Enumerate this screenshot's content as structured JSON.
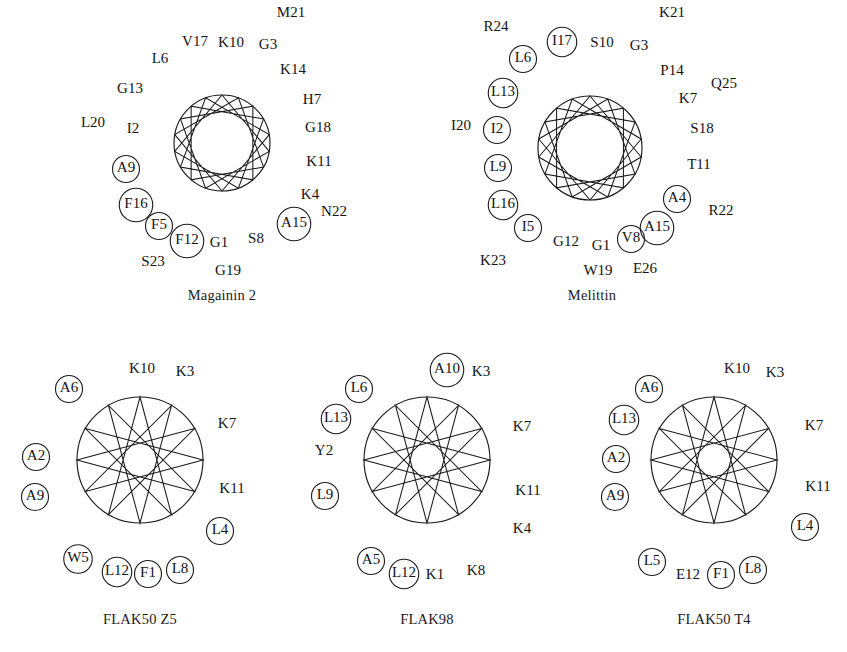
{
  "figure": {
    "width": 847,
    "height": 652,
    "background": "#ffffff",
    "ink_color": "#1b1b1b",
    "text_color": "#141414"
  },
  "panels": [
    {
      "id": "magainin2",
      "caption": "Magainin 2",
      "caption_x": 222,
      "caption_y": 296,
      "center_x": 222,
      "center_y": 143,
      "radius": 48,
      "n_vertices": 18,
      "start_angle": -90,
      "poly_step": 5,
      "residues": [
        {
          "label": "M21",
          "x": 291,
          "y": 14,
          "circled": false
        },
        {
          "label": "V17",
          "x": 195,
          "y": 43,
          "circled": false
        },
        {
          "label": "K10",
          "x": 231,
          "y": 44,
          "circled": false
        },
        {
          "label": "G3",
          "x": 268,
          "y": 46,
          "circled": false
        },
        {
          "label": "L6",
          "x": 160,
          "y": 60,
          "circled": false
        },
        {
          "label": "K14",
          "x": 293,
          "y": 71,
          "circled": false
        },
        {
          "label": "G13",
          "x": 130,
          "y": 90,
          "circled": false
        },
        {
          "label": "H7",
          "x": 312,
          "y": 101,
          "circled": false
        },
        {
          "label": "L20",
          "x": 93,
          "y": 124,
          "circled": false
        },
        {
          "label": "I2",
          "x": 133,
          "y": 130,
          "circled": false
        },
        {
          "label": "G18",
          "x": 318,
          "y": 129,
          "circled": false
        },
        {
          "label": "K11",
          "x": 319,
          "y": 163,
          "circled": false
        },
        {
          "label": "A9",
          "x": 126,
          "y": 169,
          "circled": true
        },
        {
          "label": "K4",
          "x": 310,
          "y": 196,
          "circled": false
        },
        {
          "label": "F16",
          "x": 136,
          "y": 205,
          "circled": true
        },
        {
          "label": "N22",
          "x": 334,
          "y": 213,
          "circled": false
        },
        {
          "label": "A15",
          "x": 294,
          "y": 224,
          "circled": true
        },
        {
          "label": "F5",
          "x": 159,
          "y": 226,
          "circled": true
        },
        {
          "label": "F12",
          "x": 187,
          "y": 241,
          "circled": true
        },
        {
          "label": "G1",
          "x": 219,
          "y": 244,
          "circled": false
        },
        {
          "label": "S8",
          "x": 256,
          "y": 240,
          "circled": false
        },
        {
          "label": "S23",
          "x": 153,
          "y": 263,
          "circled": false
        },
        {
          "label": "G19",
          "x": 228,
          "y": 272,
          "circled": false
        }
      ]
    },
    {
      "id": "melittin",
      "caption": "Melittin",
      "caption_x": 592,
      "caption_y": 296,
      "center_x": 590,
      "center_y": 148,
      "radius": 52,
      "n_vertices": 18,
      "start_angle": -90,
      "poly_step": 5,
      "residues": [
        {
          "label": "K21",
          "x": 672,
          "y": 14,
          "circled": false
        },
        {
          "label": "R24",
          "x": 496,
          "y": 28,
          "circled": false
        },
        {
          "label": "I17",
          "x": 562,
          "y": 42,
          "circled": true
        },
        {
          "label": "S10",
          "x": 602,
          "y": 44,
          "circled": false
        },
        {
          "label": "G3",
          "x": 639,
          "y": 47,
          "circled": false
        },
        {
          "label": "L6",
          "x": 523,
          "y": 59,
          "circled": true
        },
        {
          "label": "P14",
          "x": 672,
          "y": 72,
          "circled": false
        },
        {
          "label": "Q25",
          "x": 724,
          "y": 85,
          "circled": false
        },
        {
          "label": "L13",
          "x": 503,
          "y": 93,
          "circled": true
        },
        {
          "label": "K7",
          "x": 688,
          "y": 100,
          "circled": false
        },
        {
          "label": "I20",
          "x": 461,
          "y": 127,
          "circled": false
        },
        {
          "label": "I2",
          "x": 497,
          "y": 130,
          "circled": true
        },
        {
          "label": "S18",
          "x": 702,
          "y": 130,
          "circled": false
        },
        {
          "label": "L9",
          "x": 498,
          "y": 168,
          "circled": true
        },
        {
          "label": "T11",
          "x": 699,
          "y": 166,
          "circled": false
        },
        {
          "label": "A4",
          "x": 677,
          "y": 199,
          "circled": true
        },
        {
          "label": "L16",
          "x": 503,
          "y": 205,
          "circled": true
        },
        {
          "label": "R22",
          "x": 721,
          "y": 212,
          "circled": false
        },
        {
          "label": "A15",
          "x": 657,
          "y": 228,
          "circled": true
        },
        {
          "label": "I5",
          "x": 528,
          "y": 228,
          "circled": true
        },
        {
          "label": "G12",
          "x": 566,
          "y": 243,
          "circled": false
        },
        {
          "label": "G1",
          "x": 601,
          "y": 247,
          "circled": false
        },
        {
          "label": "V8",
          "x": 631,
          "y": 239,
          "circled": true
        },
        {
          "label": "K23",
          "x": 493,
          "y": 262,
          "circled": false
        },
        {
          "label": "W19",
          "x": 598,
          "y": 272,
          "circled": false
        },
        {
          "label": "E26",
          "x": 645,
          "y": 270,
          "circled": false
        }
      ]
    },
    {
      "id": "flak50z5",
      "caption": "FLAK50 Z5",
      "caption_x": 140,
      "caption_y": 620,
      "center_x": 140,
      "center_y": 460,
      "radius": 63,
      "n_vertices": 12,
      "start_angle": -90,
      "poly_step": 5,
      "residues": [
        {
          "label": "K10",
          "x": 142,
          "y": 370,
          "circled": false
        },
        {
          "label": "K3",
          "x": 185,
          "y": 373,
          "circled": false
        },
        {
          "label": "A6",
          "x": 69,
          "y": 389,
          "circled": true
        },
        {
          "label": "K7",
          "x": 227,
          "y": 425,
          "circled": false
        },
        {
          "label": "A2",
          "x": 36,
          "y": 457,
          "circled": true
        },
        {
          "label": "A9",
          "x": 35,
          "y": 497,
          "circled": true
        },
        {
          "label": "K11",
          "x": 232,
          "y": 490,
          "circled": false
        },
        {
          "label": "L4",
          "x": 220,
          "y": 531,
          "circled": true
        },
        {
          "label": "W5",
          "x": 78,
          "y": 559,
          "circled": true
        },
        {
          "label": "L12",
          "x": 117,
          "y": 572,
          "circled": true
        },
        {
          "label": "F1",
          "x": 148,
          "y": 574,
          "circled": true
        },
        {
          "label": "L8",
          "x": 180,
          "y": 570,
          "circled": true
        }
      ]
    },
    {
      "id": "flak98",
      "caption": "FLAK98",
      "caption_x": 427,
      "caption_y": 620,
      "center_x": 427,
      "center_y": 460,
      "radius": 63,
      "n_vertices": 12,
      "start_angle": -90,
      "poly_step": 5,
      "residues": [
        {
          "label": "A10",
          "x": 447,
          "y": 370,
          "circled": true
        },
        {
          "label": "K3",
          "x": 481,
          "y": 373,
          "circled": false
        },
        {
          "label": "L6",
          "x": 359,
          "y": 389,
          "circled": true
        },
        {
          "label": "L13",
          "x": 336,
          "y": 419,
          "circled": true
        },
        {
          "label": "K7",
          "x": 522,
          "y": 428,
          "circled": false
        },
        {
          "label": "Y2",
          "x": 324,
          "y": 452,
          "circled": false
        },
        {
          "label": "L9",
          "x": 325,
          "y": 496,
          "circled": true
        },
        {
          "label": "K11",
          "x": 528,
          "y": 492,
          "circled": false
        },
        {
          "label": "K4",
          "x": 522,
          "y": 530,
          "circled": false
        },
        {
          "label": "A5",
          "x": 371,
          "y": 561,
          "circled": true
        },
        {
          "label": "L12",
          "x": 404,
          "y": 574,
          "circled": true
        },
        {
          "label": "K1",
          "x": 435,
          "y": 576,
          "circled": false
        },
        {
          "label": "K8",
          "x": 476,
          "y": 572,
          "circled": false
        }
      ]
    },
    {
      "id": "flak50t4",
      "caption": "FLAK50 T4",
      "caption_x": 714,
      "caption_y": 620,
      "center_x": 714,
      "center_y": 460,
      "radius": 63,
      "n_vertices": 12,
      "start_angle": -90,
      "poly_step": 5,
      "residues": [
        {
          "label": "K10",
          "x": 737,
          "y": 370,
          "circled": false
        },
        {
          "label": "K3",
          "x": 775,
          "y": 374,
          "circled": false
        },
        {
          "label": "A6",
          "x": 649,
          "y": 389,
          "circled": true
        },
        {
          "label": "L13",
          "x": 624,
          "y": 420,
          "circled": true
        },
        {
          "label": "K7",
          "x": 814,
          "y": 427,
          "circled": false
        },
        {
          "label": "A2",
          "x": 616,
          "y": 459,
          "circled": true
        },
        {
          "label": "A9",
          "x": 615,
          "y": 497,
          "circled": true
        },
        {
          "label": "K11",
          "x": 818,
          "y": 488,
          "circled": false
        },
        {
          "label": "L4",
          "x": 805,
          "y": 527,
          "circled": true
        },
        {
          "label": "L5",
          "x": 652,
          "y": 562,
          "circled": true
        },
        {
          "label": "E12",
          "x": 688,
          "y": 576,
          "circled": false
        },
        {
          "label": "F1",
          "x": 721,
          "y": 575,
          "circled": true
        },
        {
          "label": "L8",
          "x": 753,
          "y": 570,
          "circled": true
        }
      ]
    }
  ]
}
